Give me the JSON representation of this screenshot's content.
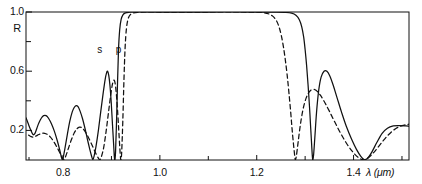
{
  "chart_data": {
    "type": "line",
    "title": "",
    "xlabel": "λ (μm)",
    "ylabel": "R",
    "xlim": [
      0.7235,
      1.5145
    ],
    "ylim": [
      0.0,
      1.0
    ],
    "grid": false,
    "legend": "inline-curve-labels",
    "x_ticks": [
      0.8,
      1.0,
      1.2,
      1.4
    ],
    "x_tick_labels": [
      "0.8",
      "1.0",
      "1.2",
      "1.4"
    ],
    "x_minor_ticks": [
      0.9,
      1.1,
      1.3,
      1.5
    ],
    "y_ticks": [
      0.2,
      0.4,
      0.6,
      0.8,
      1.0
    ],
    "y_tick_labels": [
      "0.2",
      "",
      "0.6",
      "",
      "1.0"
    ],
    "annotations": [
      {
        "text": "s",
        "x": 0.877,
        "y": 0.735,
        "curve": "s-polarization"
      },
      {
        "text": "p",
        "x": 0.913,
        "y": 0.735,
        "curve": "p-polarization"
      }
    ],
    "series": [
      {
        "name": "s-polarization",
        "label": "s",
        "style": "solid",
        "color": "#111111",
        "points": [
          [
            0.7235,
            0.285
          ],
          [
            0.728,
            0.246
          ],
          [
            0.733,
            0.205
          ],
          [
            0.738,
            0.172
          ],
          [
            0.742,
            0.18
          ],
          [
            0.746,
            0.215
          ],
          [
            0.75,
            0.25
          ],
          [
            0.755,
            0.282
          ],
          [
            0.76,
            0.3
          ],
          [
            0.765,
            0.3
          ],
          [
            0.77,
            0.282
          ],
          [
            0.776,
            0.245
          ],
          [
            0.782,
            0.195
          ],
          [
            0.788,
            0.132
          ],
          [
            0.793,
            0.07
          ],
          [
            0.7965,
            0.02
          ],
          [
            0.7985,
            0.002
          ],
          [
            0.8005,
            0.02
          ],
          [
            0.804,
            0.08
          ],
          [
            0.809,
            0.175
          ],
          [
            0.814,
            0.262
          ],
          [
            0.819,
            0.325
          ],
          [
            0.823,
            0.355
          ],
          [
            0.827,
            0.368
          ],
          [
            0.831,
            0.36
          ],
          [
            0.835,
            0.332
          ],
          [
            0.84,
            0.282
          ],
          [
            0.845,
            0.218
          ],
          [
            0.85,
            0.145
          ],
          [
            0.855,
            0.075
          ],
          [
            0.859,
            0.025
          ],
          [
            0.8615,
            0.003
          ],
          [
            0.864,
            0.025
          ],
          [
            0.868,
            0.09
          ],
          [
            0.873,
            0.2
          ],
          [
            0.878,
            0.33
          ],
          [
            0.883,
            0.455
          ],
          [
            0.887,
            0.545
          ],
          [
            0.89,
            0.59
          ],
          [
            0.892,
            0.6
          ],
          [
            0.8945,
            0.57
          ],
          [
            0.897,
            0.5
          ],
          [
            0.8995,
            0.39
          ],
          [
            0.902,
            0.245
          ],
          [
            0.9045,
            0.105
          ],
          [
            0.906,
            0.02
          ],
          [
            0.9072,
            0.002
          ],
          [
            0.9085,
            0.06
          ],
          [
            0.9105,
            0.26
          ],
          [
            0.9125,
            0.52
          ],
          [
            0.9145,
            0.74
          ],
          [
            0.917,
            0.88
          ],
          [
            0.92,
            0.95
          ],
          [
            0.924,
            0.982
          ],
          [
            0.929,
            0.994
          ],
          [
            0.936,
            0.998
          ],
          [
            0.95,
            1.0
          ],
          [
            1.0,
            1.0
          ],
          [
            1.1,
            1.0
          ],
          [
            1.2,
            1.0
          ],
          [
            1.24,
            0.999
          ],
          [
            1.26,
            0.997
          ],
          [
            1.272,
            0.992
          ],
          [
            1.281,
            0.978
          ],
          [
            1.288,
            0.948
          ],
          [
            1.293,
            0.9
          ],
          [
            1.297,
            0.83
          ],
          [
            1.3,
            0.745
          ],
          [
            1.303,
            0.64
          ],
          [
            1.306,
            0.51
          ],
          [
            1.309,
            0.36
          ],
          [
            1.3115,
            0.215
          ],
          [
            1.3135,
            0.1
          ],
          [
            1.315,
            0.02
          ],
          [
            1.316,
            0.002
          ],
          [
            1.3175,
            0.035
          ],
          [
            1.32,
            0.15
          ],
          [
            1.3235,
            0.32
          ],
          [
            1.328,
            0.47
          ],
          [
            1.333,
            0.56
          ],
          [
            1.339,
            0.6
          ],
          [
            1.345,
            0.6
          ],
          [
            1.351,
            0.568
          ],
          [
            1.358,
            0.505
          ],
          [
            1.366,
            0.42
          ],
          [
            1.375,
            0.325
          ],
          [
            1.385,
            0.228
          ],
          [
            1.396,
            0.14
          ],
          [
            1.406,
            0.072
          ],
          [
            1.415,
            0.025
          ],
          [
            1.422,
            0.003
          ],
          [
            1.429,
            0.012
          ],
          [
            1.438,
            0.055
          ],
          [
            1.448,
            0.118
          ],
          [
            1.459,
            0.18
          ],
          [
            1.47,
            0.215
          ],
          [
            1.482,
            0.23
          ],
          [
            1.495,
            0.232
          ],
          [
            1.508,
            0.23
          ],
          [
            1.5145,
            0.228
          ]
        ]
      },
      {
        "name": "p-polarization",
        "label": "p",
        "style": "dashed",
        "color": "#111111",
        "points": [
          [
            0.729,
            0.168
          ],
          [
            0.734,
            0.158
          ],
          [
            0.739,
            0.155
          ],
          [
            0.744,
            0.162
          ],
          [
            0.75,
            0.172
          ],
          [
            0.756,
            0.18
          ],
          [
            0.762,
            0.18
          ],
          [
            0.768,
            0.172
          ],
          [
            0.774,
            0.155
          ],
          [
            0.78,
            0.128
          ],
          [
            0.786,
            0.095
          ],
          [
            0.792,
            0.058
          ],
          [
            0.7975,
            0.022
          ],
          [
            0.8015,
            0.002
          ],
          [
            0.8055,
            0.025
          ],
          [
            0.811,
            0.078
          ],
          [
            0.817,
            0.135
          ],
          [
            0.823,
            0.182
          ],
          [
            0.829,
            0.212
          ],
          [
            0.834,
            0.222
          ],
          [
            0.839,
            0.218
          ],
          [
            0.844,
            0.2
          ],
          [
            0.85,
            0.168
          ],
          [
            0.856,
            0.128
          ],
          [
            0.862,
            0.085
          ],
          [
            0.868,
            0.042
          ],
          [
            0.873,
            0.012
          ],
          [
            0.876,
            0.002
          ],
          [
            0.879,
            0.02
          ],
          [
            0.884,
            0.085
          ],
          [
            0.889,
            0.195
          ],
          [
            0.894,
            0.325
          ],
          [
            0.8985,
            0.44
          ],
          [
            0.902,
            0.512
          ],
          [
            0.905,
            0.54
          ],
          [
            0.9075,
            0.52
          ],
          [
            0.91,
            0.45
          ],
          [
            0.9125,
            0.34
          ],
          [
            0.915,
            0.205
          ],
          [
            0.9172,
            0.085
          ],
          [
            0.9188,
            0.012
          ],
          [
            0.9198,
            0.002
          ],
          [
            0.9212,
            0.06
          ],
          [
            0.9235,
            0.27
          ],
          [
            0.9258,
            0.54
          ],
          [
            0.9282,
            0.76
          ],
          [
            0.931,
            0.89
          ],
          [
            0.9345,
            0.955
          ],
          [
            0.939,
            0.982
          ],
          [
            0.945,
            0.993
          ],
          [
            0.954,
            0.998
          ],
          [
            0.97,
            1.0
          ],
          [
            1.0,
            1.0
          ],
          [
            1.1,
            1.0
          ],
          [
            1.17,
            1.0
          ],
          [
            1.195,
            0.999
          ],
          [
            1.212,
            0.996
          ],
          [
            1.224,
            0.988
          ],
          [
            1.233,
            0.972
          ],
          [
            1.24,
            0.945
          ],
          [
            1.2455,
            0.905
          ],
          [
            1.2505,
            0.845
          ],
          [
            1.255,
            0.768
          ],
          [
            1.259,
            0.678
          ],
          [
            1.263,
            0.57
          ],
          [
            1.2665,
            0.455
          ],
          [
            1.27,
            0.33
          ],
          [
            1.273,
            0.21
          ],
          [
            1.276,
            0.105
          ],
          [
            1.2785,
            0.028
          ],
          [
            1.28,
            0.002
          ],
          [
            1.282,
            0.03
          ],
          [
            1.2855,
            0.12
          ],
          [
            1.29,
            0.235
          ],
          [
            1.2955,
            0.34
          ],
          [
            1.302,
            0.418
          ],
          [
            1.309,
            0.462
          ],
          [
            1.316,
            0.478
          ],
          [
            1.323,
            0.47
          ],
          [
            1.331,
            0.44
          ],
          [
            1.34,
            0.392
          ],
          [
            1.35,
            0.33
          ],
          [
            1.361,
            0.258
          ],
          [
            1.373,
            0.182
          ],
          [
            1.386,
            0.11
          ],
          [
            1.399,
            0.052
          ],
          [
            1.411,
            0.014
          ],
          [
            1.42,
            0.002
          ],
          [
            1.429,
            0.012
          ],
          [
            1.44,
            0.045
          ],
          [
            1.452,
            0.092
          ],
          [
            1.465,
            0.145
          ],
          [
            1.479,
            0.192
          ],
          [
            1.494,
            0.225
          ],
          [
            1.508,
            0.238
          ],
          [
            1.5145,
            0.242
          ]
        ]
      }
    ]
  },
  "axes": {
    "y_title": "R",
    "x_title": "λ (μm)",
    "y_labels": [
      {
        "text": "1.0",
        "value": 1.0
      },
      {
        "text": "0.6",
        "value": 0.6
      },
      {
        "text": "0.2",
        "value": 0.2
      }
    ],
    "x_labels": [
      {
        "text": "0.8",
        "value": 0.8
      },
      {
        "text": "1.0",
        "value": 1.0
      },
      {
        "text": "1.2",
        "value": 1.2
      },
      {
        "text": "1.4",
        "value": 1.4
      }
    ]
  }
}
